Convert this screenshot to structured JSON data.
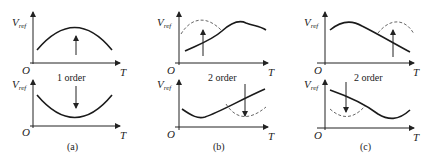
{
  "figure": {
    "panels": [
      {
        "id": "a",
        "caption": "(a)",
        "order_label": "1 order",
        "top": {
          "y_label": "V",
          "y_sub": "ref",
          "origin": "O",
          "x_label": "T",
          "arrow": "up"
        },
        "bottom": {
          "y_label": "V",
          "y_sub": "ref",
          "origin": "O",
          "x_label": "T",
          "arrow": "down"
        }
      },
      {
        "id": "b",
        "caption": "(b)",
        "order_label": "2 order",
        "top": {
          "y_label": "V",
          "y_sub": "ref",
          "origin": "O",
          "x_label": "T",
          "arrow": "up"
        },
        "bottom": {
          "y_label": "V",
          "y_sub": "ref",
          "origin": "O",
          "x_label": "T",
          "arrow": "down"
        }
      },
      {
        "id": "c",
        "caption": "(c)",
        "order_label": "2 order",
        "top": {
          "y_label": "V",
          "y_sub": "ref",
          "origin": "O",
          "x_label": "T",
          "arrow": "up"
        },
        "bottom": {
          "y_label": "V",
          "y_sub": "ref",
          "origin": "O",
          "x_label": "T",
          "arrow": "down"
        }
      }
    ]
  }
}
